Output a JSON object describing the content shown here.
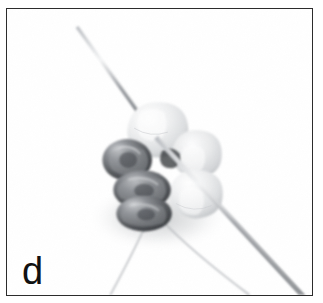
{
  "figure": {
    "domain": "natural-image",
    "panel_label": "d",
    "background_color": "#ffffff",
    "frame": {
      "border_color": "#2c2c2c",
      "border_width_px": 1.6,
      "left_px": 6,
      "top_px": 8,
      "width_px": 307,
      "height_px": 288
    },
    "scene": {
      "needle": {
        "name": "beading-needle",
        "color": "#8d9096",
        "highlight_color": "#f2f3f5",
        "tip_point": "upper-left",
        "tip_x": 78,
        "tip_y": 25,
        "exit_x": 300,
        "exit_y": 296,
        "description": "long thin steel needle running diagonally from upper-left tip down through the bead cluster and exiting the lower-right corner"
      },
      "threads": [
        {
          "name": "thread-left",
          "color": "#a9acb1",
          "start_x": 146,
          "start_y": 222,
          "end_x": 112,
          "end_y": 296
        },
        {
          "name": "thread-right",
          "color": "#a9acb1",
          "start_x": 160,
          "start_y": 220,
          "end_x": 248,
          "end_y": 296
        }
      ],
      "bead_cluster": {
        "name": "bead-cluster",
        "center_x": 160,
        "center_y": 165,
        "width_px": 112,
        "height_px": 122,
        "shadow_color": "#c9cbcd",
        "beads": [
          {
            "name": "bead-translucent-top",
            "type": "translucent",
            "cx": 152,
            "cy": 126,
            "rx": 28,
            "ry": 24,
            "fill": "#e6e7e9",
            "highlight": "#fbfbfc"
          },
          {
            "name": "bead-translucent-upper-right",
            "type": "translucent",
            "cx": 191,
            "cy": 152,
            "rx": 24,
            "ry": 22,
            "fill": "#e2e3e5",
            "highlight": "#f9f9fa"
          },
          {
            "name": "bead-translucent-right",
            "type": "translucent",
            "cx": 190,
            "cy": 190,
            "rx": 25,
            "ry": 23,
            "fill": "#dedfe1",
            "highlight": "#f7f7f8"
          },
          {
            "name": "bead-metallic-upper-left",
            "type": "metallic",
            "cx": 127,
            "cy": 160,
            "rx": 22,
            "ry": 19,
            "fill": "#6e7175",
            "highlight": "#c8cacd"
          },
          {
            "name": "bead-metallic-middle",
            "type": "metallic",
            "cx": 140,
            "cy": 188,
            "rx": 26,
            "ry": 18,
            "fill": "#626569",
            "highlight": "#bfc1c4"
          },
          {
            "name": "bead-metallic-lower",
            "type": "metallic",
            "cx": 142,
            "cy": 212,
            "rx": 25,
            "ry": 16,
            "fill": "#5c5f63",
            "highlight": "#b8babd"
          }
        ]
      }
    }
  }
}
